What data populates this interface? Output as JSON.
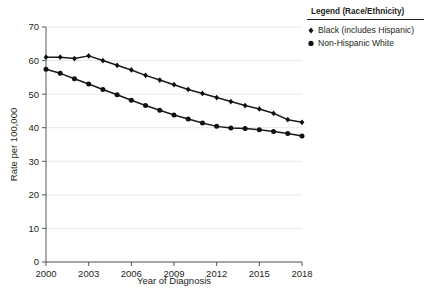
{
  "chart_data": {
    "type": "line",
    "title": "",
    "xlabel": "Year of Diagnosis",
    "ylabel": "Rate per 100,000",
    "x": [
      2000,
      2001,
      2002,
      2003,
      2004,
      2005,
      2006,
      2007,
      2008,
      2009,
      2010,
      2011,
      2012,
      2013,
      2014,
      2015,
      2016,
      2017,
      2018
    ],
    "xlim": [
      2000,
      2018
    ],
    "ylim": [
      0,
      70
    ],
    "xticks": [
      2000,
      2003,
      2006,
      2009,
      2012,
      2015,
      2018
    ],
    "xtick_labels": [
      "2000",
      "2003",
      "2006",
      "2009",
      "2012",
      "2015",
      "2018"
    ],
    "yticks": [
      0,
      10,
      20,
      30,
      40,
      50,
      60,
      70
    ],
    "ytick_labels": [
      "0",
      "10",
      "20",
      "30",
      "40",
      "50",
      "60",
      "70"
    ],
    "grid": true,
    "grid_axis": "y",
    "legend_position": "top-right",
    "series": [
      {
        "name": "Black (includes Hispanic)",
        "marker": "diamond",
        "color": "#111111",
        "values": [
          61.0,
          61.0,
          60.6,
          61.4,
          60.0,
          58.6,
          57.2,
          55.6,
          54.2,
          52.8,
          51.4,
          50.2,
          49.0,
          47.8,
          46.6,
          45.6,
          44.3,
          42.4,
          41.6
        ]
      },
      {
        "name": "Non-Hispanic White",
        "marker": "circle",
        "color": "#111111",
        "values": [
          57.4,
          56.2,
          54.6,
          53.0,
          51.4,
          49.8,
          48.2,
          46.6,
          45.2,
          43.8,
          42.6,
          41.4,
          40.4,
          39.9,
          39.8,
          39.4,
          38.9,
          38.3,
          37.5
        ]
      }
    ]
  },
  "legend": {
    "title": "Legend (Race/Ethnicity)",
    "entries": [
      {
        "label": "Black (includes Hispanic)",
        "marker": "diamond"
      },
      {
        "label": "Non-Hispanic White",
        "marker": "circle"
      }
    ]
  }
}
